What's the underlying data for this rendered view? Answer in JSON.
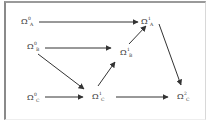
{
  "diagram": {
    "nodes": [
      {
        "id": "A0",
        "base": "Ω",
        "sup": "0",
        "sub": "A"
      },
      {
        "id": "B0",
        "base": "Ω",
        "sup": "0",
        "sub": "B"
      },
      {
        "id": "C0",
        "base": "Ω",
        "sup": "0",
        "sub": "C"
      },
      {
        "id": "A1",
        "base": "Ω",
        "sup": "1",
        "sub": "A"
      },
      {
        "id": "B1",
        "base": "Ω",
        "sup": "1",
        "sub": "B"
      },
      {
        "id": "C1",
        "base": "Ω",
        "sup": "1",
        "sub": "C"
      },
      {
        "id": "C2",
        "base": "Ω",
        "sup": "2",
        "sub": "C"
      }
    ],
    "edges": [
      {
        "from": "A0",
        "to": "A1"
      },
      {
        "from": "B0",
        "to": "B1"
      },
      {
        "from": "B0",
        "to": "C1"
      },
      {
        "from": "C0",
        "to": "C1"
      },
      {
        "from": "C1",
        "to": "B1"
      },
      {
        "from": "B1",
        "to": "A1"
      },
      {
        "from": "A1",
        "to": "C2"
      },
      {
        "from": "C1",
        "to": "C2"
      }
    ],
    "colors": {
      "line": "#333333",
      "text": "#333333",
      "frame": "#9a9a9a"
    }
  }
}
